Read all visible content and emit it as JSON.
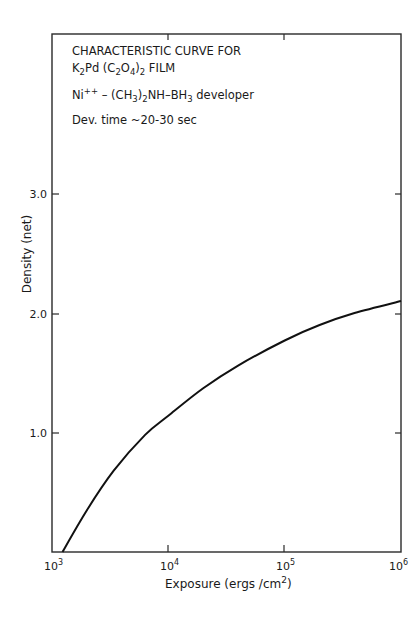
{
  "chart_data": {
    "type": "line",
    "annotations": [
      "CHARACTERISTIC CURVE FOR",
      "K2Pd (C2O4)2 FILM",
      "Ni++ – (CH3)2NH–BH3 developer",
      "Dev. time ~20-30 sec"
    ],
    "xlabel": "Exposure (ergs/cm²)",
    "ylabel": "Density (net)",
    "xscale": "log",
    "xlim": [
      1000,
      1000000
    ],
    "ylim": [
      0,
      4.35
    ],
    "x_ticks": [
      "10³",
      "10⁴",
      "10⁵",
      "10⁶"
    ],
    "x_tick_values": [
      1000,
      10000,
      100000,
      1000000
    ],
    "y_ticks": [
      "1.0",
      "2.0",
      "3.0"
    ],
    "y_tick_values": [
      1.0,
      2.0,
      3.0
    ],
    "grid": false,
    "legend": null,
    "series": [
      {
        "name": "Characteristic curve",
        "x_log10": [
          3.09,
          3.3,
          3.53,
          3.8,
          4.0,
          4.3,
          4.6,
          5.0,
          5.3,
          5.6,
          6.0
        ],
        "y": [
          0.0,
          0.35,
          0.68,
          0.98,
          1.14,
          1.37,
          1.56,
          1.77,
          1.9,
          2.0,
          2.1
        ]
      }
    ]
  },
  "text": {
    "line1": "CHARACTERISTIC CURVE FOR",
    "line2_a": "K",
    "line2_sub1": "2",
    "line2_b": "Pd (C",
    "line2_sub2": "2",
    "line2_c": "O",
    "line2_sub3": "4",
    "line2_d": ")",
    "line2_sub4": "2",
    "line2_e": "  FILM",
    "line3_a": "Ni",
    "line3_sup": "++",
    "line3_b": " – (CH",
    "line3_sub1": "3",
    "line3_c": ")",
    "line3_sub2": "2",
    "line3_d": "NH–BH",
    "line3_sub3": "3",
    "line3_e": "  developer",
    "line4": "Dev. time  ~20-30 sec",
    "ylabel": "Density (net)",
    "xlabel_a": "Exposure (ergs /cm",
    "xlabel_sup": "2",
    "xlabel_b": ")",
    "xt0_base": "10",
    "xt0_exp": "3",
    "xt1_base": "10",
    "xt1_exp": "4",
    "xt2_base": "10",
    "xt2_exp": "5",
    "xt3_base": "10",
    "xt3_exp": "6",
    "yt1": "1.0",
    "yt2": "2.0",
    "yt3": "3.0"
  }
}
